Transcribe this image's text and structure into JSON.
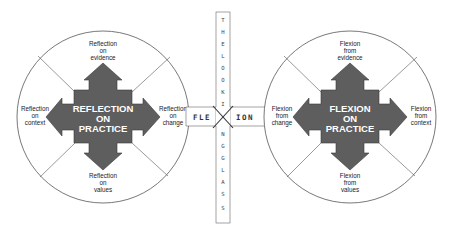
{
  "colors": {
    "shape_fill": "#5e5e5e",
    "shape_stroke": "#3a3a3a",
    "line": "#555555",
    "center_text": "#ffffff",
    "label_text": "#222222"
  },
  "left": {
    "center": [
      "REFLECTION",
      "ON",
      "PRACTICE"
    ],
    "top": [
      "Reflection",
      "on",
      "evidence"
    ],
    "left": [
      "Reflection",
      "on",
      "context"
    ],
    "right": [
      "Reflection",
      "on",
      "change"
    ],
    "bottom": [
      "Reflection",
      "on",
      "values"
    ]
  },
  "right": {
    "center": [
      "FLEXION",
      "ON",
      "PRACTICE"
    ],
    "top": [
      "Flexion",
      "from",
      "evidence"
    ],
    "left": [
      "Flexion",
      "from",
      "change"
    ],
    "right": [
      "Flexion",
      "from",
      "context"
    ],
    "bottom": [
      "Flexion",
      "from",
      "values"
    ]
  },
  "looking_glass": {
    "letters": [
      "T",
      "H",
      "E",
      "",
      "L",
      "O",
      "O",
      "K",
      "I",
      "N",
      "G",
      "",
      "G",
      "L",
      "A",
      "S",
      "S"
    ]
  },
  "band": {
    "left_text": "FLE",
    "right_text": "ION",
    "cross_symbol": "X"
  }
}
